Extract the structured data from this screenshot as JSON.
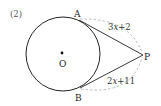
{
  "problem_number": "(2)",
  "figure": {
    "circle": {
      "center_label": "O",
      "cx": 63,
      "cy": 54,
      "r": 37
    },
    "points": {
      "A": {
        "label": "A",
        "x": 79,
        "y": 20
      },
      "B": {
        "label": "B",
        "x": 80,
        "y": 87
      },
      "P": {
        "label": "P",
        "x": 143,
        "y": 55
      }
    },
    "segments": [
      {
        "from": "A",
        "to": "P",
        "label": "3x+2",
        "label_parts": [
          "3",
          "x",
          "+2"
        ]
      },
      {
        "from": "B",
        "to": "P",
        "label": "2x+11",
        "label_parts": [
          "2",
          "x",
          "+11"
        ]
      }
    ],
    "colors": {
      "stroke": "#222222",
      "dashed": "#aaaaaa"
    }
  }
}
